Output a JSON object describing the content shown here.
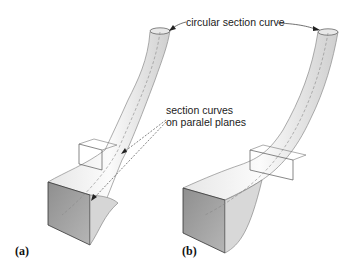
{
  "annotations": {
    "circular_section": "circular section curve",
    "section_curves_line1": "section curves",
    "section_curves_line2": "on paralel planes"
  },
  "panels": [
    {
      "label": "(a)"
    },
    {
      "label": "(b)"
    }
  ],
  "colors": {
    "surface_light": "#f2f2f2",
    "surface_mid": "#d8d8d8",
    "face_dark": "#9a9a9a",
    "outline": "#444444"
  }
}
